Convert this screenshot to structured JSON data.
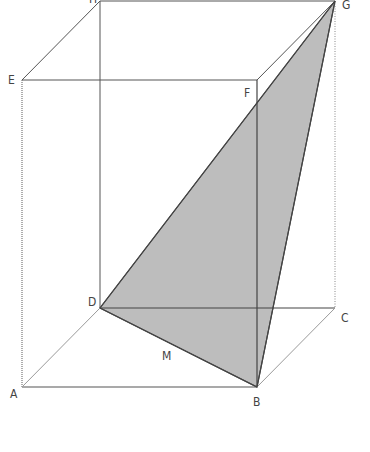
{
  "diagram": {
    "colors": {
      "edge": "#555555",
      "hidden_edge": "#8a8a8a",
      "shade_fill": "#bdbdbd",
      "shade_edge": "#444444",
      "label": "#444444",
      "background": "#ffffff"
    },
    "vertices": {
      "A": {
        "label": "A",
        "x": 22,
        "y": 387,
        "lx": 10,
        "ly": 398
      },
      "B": {
        "label": "B",
        "x": 257,
        "y": 387,
        "lx": 253,
        "ly": 406
      },
      "C": {
        "label": "C",
        "x": 335,
        "y": 308,
        "lx": 341,
        "ly": 322
      },
      "D": {
        "label": "D",
        "x": 100,
        "y": 308,
        "lx": 88,
        "ly": 306
      },
      "E": {
        "label": "E",
        "x": 22,
        "y": 80,
        "lx": 8,
        "ly": 84
      },
      "F": {
        "label": "F",
        "x": 257,
        "y": 80,
        "lx": 244,
        "ly": 97
      },
      "G": {
        "label": "G",
        "x": 335,
        "y": 1,
        "lx": 342,
        "ly": 9
      },
      "H": {
        "label": "H",
        "x": 100,
        "y": 1,
        "lx": 89,
        "ly": 3
      }
    },
    "midpoint": {
      "label": "M",
      "lx": 162,
      "ly": 360
    },
    "shaded_face": [
      "D",
      "B",
      "G"
    ],
    "edges_solid": [
      [
        "E",
        "F"
      ],
      [
        "F",
        "G"
      ],
      [
        "G",
        "H"
      ],
      [
        "H",
        "E"
      ],
      [
        "A",
        "B"
      ],
      [
        "F",
        "B"
      ],
      [
        "D",
        "C"
      ],
      [
        "H",
        "D"
      ]
    ],
    "edges_dotted": [
      [
        "E",
        "A"
      ],
      [
        "G",
        "C"
      ]
    ],
    "edges_light": [
      [
        "A",
        "D"
      ],
      [
        "B",
        "C"
      ]
    ]
  }
}
